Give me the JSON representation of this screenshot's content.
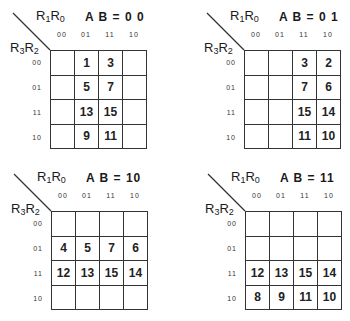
{
  "column_variable": "R1R0",
  "row_variable": "R3R2",
  "column_labels": [
    "00",
    "01",
    "11",
    "10"
  ],
  "row_labels": [
    "00",
    "01",
    "11",
    "10"
  ],
  "maps": [
    {
      "title": "A B = 0 0",
      "cells": [
        [
          "",
          "1",
          "3",
          ""
        ],
        [
          "",
          "5",
          "7",
          ""
        ],
        [
          "",
          "13",
          "15",
          ""
        ],
        [
          "",
          "9",
          "11",
          ""
        ]
      ]
    },
    {
      "title": "A B = 0 1",
      "cells": [
        [
          "",
          "",
          "3",
          "2"
        ],
        [
          "",
          "",
          "7",
          "6"
        ],
        [
          "",
          "",
          "15",
          "14"
        ],
        [
          "",
          "",
          "11",
          "10"
        ]
      ]
    },
    {
      "title": "A B = 10",
      "cells": [
        [
          "",
          "",
          "",
          ""
        ],
        [
          "4",
          "5",
          "7",
          "6"
        ],
        [
          "12",
          "13",
          "15",
          "14"
        ],
        [
          "",
          "",
          "",
          ""
        ]
      ]
    },
    {
      "title": "A B = 11",
      "cells": [
        [
          "",
          "",
          "",
          ""
        ],
        [
          "",
          "",
          "",
          ""
        ],
        [
          "12",
          "13",
          "15",
          "14"
        ],
        [
          "8",
          "9",
          "11",
          "10"
        ]
      ]
    }
  ]
}
